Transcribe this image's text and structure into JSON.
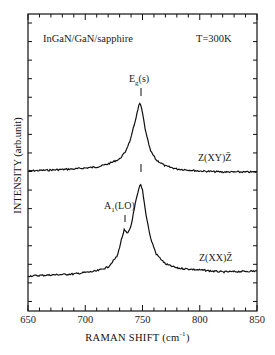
{
  "chart_data": {
    "type": "line",
    "title": "",
    "xlabel": "RAMAN SHIFT (cm-1)",
    "ylabel": "INTENSITY (arb.unit)",
    "xlim": [
      650,
      850
    ],
    "xticks": [
      650,
      700,
      750,
      800,
      850
    ],
    "grid": false,
    "legend": "none (inline labels)",
    "annotations": {
      "sample": "InGaN/GaN/sapphire",
      "temperature": "T=300K",
      "peak_upper": "Eg(s)",
      "peak_lower": "A1(LO)"
    },
    "series": [
      {
        "name": "Z(XY)Z̄",
        "x": [
          650,
          670,
          690,
          710,
          720,
          730,
          735,
          740,
          744,
          747,
          748,
          750,
          753,
          757,
          762,
          770,
          780,
          800,
          820,
          850
        ],
        "y_rel": [
          0.0,
          0.01,
          0.02,
          0.04,
          0.07,
          0.12,
          0.19,
          0.33,
          0.52,
          0.66,
          0.68,
          0.58,
          0.38,
          0.2,
          0.11,
          0.05,
          0.02,
          0.0,
          -0.01,
          -0.01
        ]
      },
      {
        "name": "Z(XX)Z̄",
        "x": [
          650,
          670,
          690,
          710,
          720,
          728,
          732,
          734,
          737,
          740,
          744,
          748,
          750,
          753,
          757,
          762,
          770,
          780,
          800,
          820,
          850
        ],
        "y_rel": [
          0.0,
          0.01,
          0.02,
          0.05,
          0.09,
          0.2,
          0.38,
          0.46,
          0.42,
          0.5,
          0.74,
          0.92,
          0.86,
          0.62,
          0.38,
          0.22,
          0.12,
          0.08,
          0.06,
          0.04,
          0.05
        ]
      }
    ],
    "peaks": [
      {
        "series": "Z(XY)Z̄",
        "label": "Eg(s)",
        "x": 748
      },
      {
        "series": "Z(XX)Z̄",
        "label": "A1(LO)",
        "x": 734
      },
      {
        "series": "Z(XX)Z̄",
        "label": "",
        "x": 748
      }
    ]
  },
  "labels": {
    "sample": "InGaN/GaN/sapphire",
    "temp": "T=300K",
    "eg_main": "E",
    "eg_sub": "g",
    "eg_tail": "(s)",
    "a1_main": "A",
    "a1_sub": "1",
    "a1_tail": "(LO)",
    "xy_label": "Z(XY)Z̄",
    "xx_label": "Z(XX)Z̄",
    "ylabel": "INTENSITY  (arb.unit)",
    "xlabel_main": "RAMAN  SHIFT  (cm",
    "xlabel_sup": "-1",
    "xlabel_tail": ")",
    "xticks": [
      "650",
      "700",
      "750",
      "800",
      "850"
    ]
  }
}
